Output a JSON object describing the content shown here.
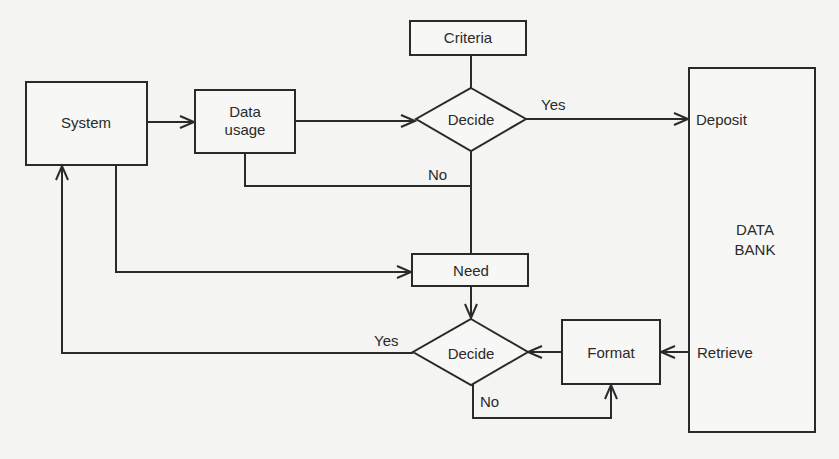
{
  "diagram": {
    "nodes": {
      "system": {
        "label": "System",
        "shape": "rectangle"
      },
      "data_usage": {
        "label_line1": "Data",
        "label_line2": "usage",
        "shape": "rectangle"
      },
      "criteria": {
        "label": "Criteria",
        "shape": "rectangle"
      },
      "decide_top": {
        "label": "Decide",
        "shape": "diamond"
      },
      "need": {
        "label": "Need",
        "shape": "rectangle"
      },
      "decide_bottom": {
        "label": "Decide",
        "shape": "diamond"
      },
      "format": {
        "label": "Format",
        "shape": "rectangle"
      },
      "data_bank": {
        "label_line1": "DATA",
        "label_line2": "BANK",
        "shape": "rectangle",
        "port_deposit": "Deposit",
        "port_retrieve": "Retrieve"
      }
    },
    "edge_labels": {
      "top_yes": "Yes",
      "top_no": "No",
      "bottom_yes": "Yes",
      "bottom_no": "No"
    },
    "edges": [
      {
        "from": "System",
        "to": "Data usage"
      },
      {
        "from": "Data usage",
        "to": "Decide (top)"
      },
      {
        "from": "Criteria",
        "to": "Decide (top)"
      },
      {
        "from": "Decide (top)",
        "to": "Deposit",
        "label": "Yes"
      },
      {
        "from": "Data usage",
        "to": "Need",
        "label": "No",
        "via": "Decide (top)"
      },
      {
        "from": "System",
        "to": "Need"
      },
      {
        "from": "Need",
        "to": "Decide (bottom)"
      },
      {
        "from": "Retrieve",
        "to": "Format"
      },
      {
        "from": "Format",
        "to": "Decide (bottom)"
      },
      {
        "from": "Decide (bottom)",
        "to": "System",
        "label": "Yes"
      },
      {
        "from": "Decide (bottom)",
        "to": "Format",
        "label": "No"
      }
    ]
  }
}
